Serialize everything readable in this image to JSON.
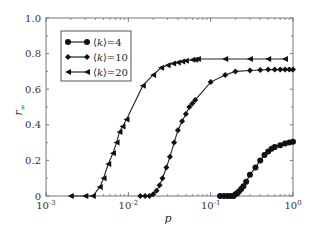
{
  "chart_data": {
    "type": "line",
    "title": "",
    "xlabel": "p",
    "ylabel": "r∞",
    "xscale": "log",
    "xlim": [
      0.001,
      1
    ],
    "ylim": [
      0,
      1.0
    ],
    "xticks": [
      {
        "value": 0.001,
        "base": "10",
        "exp": "-3"
      },
      {
        "value": 0.01,
        "base": "10",
        "exp": "-2"
      },
      {
        "value": 0.1,
        "base": "10",
        "exp": "-1"
      },
      {
        "value": 1,
        "base": "10",
        "exp": "0"
      }
    ],
    "yticks": [
      {
        "value": 0,
        "label": "0"
      },
      {
        "value": 0.2,
        "label": "0.2"
      },
      {
        "value": 0.4,
        "label": "0.4"
      },
      {
        "value": 0.6,
        "label": "0.6"
      },
      {
        "value": 0.8,
        "label": "0.8"
      },
      {
        "value": 1.0,
        "label": "1.0"
      }
    ],
    "grid": false,
    "legend_position": "upper left",
    "series": [
      {
        "name": "⟨k⟩=4",
        "legend_k": "k",
        "legend_value": "=4",
        "marker": "circle",
        "x": [
          0.13,
          0.145,
          0.16,
          0.175,
          0.19,
          0.2,
          0.21,
          0.22,
          0.235,
          0.25,
          0.27,
          0.3,
          0.35,
          0.4,
          0.45,
          0.5,
          0.55,
          0.6,
          0.7,
          0.8,
          0.9,
          1.0
        ],
        "y": [
          0.0,
          0.0,
          0.0,
          0.0,
          0.0,
          0.01,
          0.015,
          0.025,
          0.04,
          0.055,
          0.08,
          0.12,
          0.16,
          0.2,
          0.23,
          0.25,
          0.265,
          0.275,
          0.285,
          0.295,
          0.3,
          0.305
        ]
      },
      {
        "name": "⟨k⟩=10",
        "legend_k": "k",
        "legend_value": "=10",
        "marker": "diamond",
        "x": [
          0.014,
          0.016,
          0.018,
          0.02,
          0.022,
          0.024,
          0.026,
          0.029,
          0.032,
          0.036,
          0.04,
          0.045,
          0.05,
          0.055,
          0.06,
          0.065,
          0.1,
          0.15,
          0.2,
          0.3,
          0.4,
          0.5,
          0.6,
          0.7,
          0.8,
          0.9,
          1.0
        ],
        "y": [
          0.0,
          0.0,
          0.0,
          0.01,
          0.03,
          0.06,
          0.1,
          0.16,
          0.22,
          0.3,
          0.37,
          0.42,
          0.46,
          0.5,
          0.52,
          0.54,
          0.64,
          0.68,
          0.7,
          0.705,
          0.708,
          0.71,
          0.71,
          0.71,
          0.71,
          0.71,
          0.71
        ]
      },
      {
        "name": "⟨k⟩=20",
        "legend_k": "k",
        "legend_value": "=20",
        "marker": "triangle-left",
        "x": [
          0.002,
          0.003,
          0.0037,
          0.0045,
          0.005,
          0.0057,
          0.0065,
          0.0072,
          0.0078,
          0.0085,
          0.0095,
          0.015,
          0.02,
          0.025,
          0.03,
          0.035,
          0.04,
          0.045,
          0.05,
          0.06,
          0.065,
          0.07,
          0.15,
          0.3,
          0.5,
          0.8
        ],
        "y": [
          0.0,
          0.0,
          0.0,
          0.05,
          0.1,
          0.18,
          0.24,
          0.3,
          0.36,
          0.39,
          0.43,
          0.62,
          0.68,
          0.72,
          0.735,
          0.745,
          0.75,
          0.755,
          0.76,
          0.765,
          0.765,
          0.77,
          0.77,
          0.77,
          0.77,
          0.77
        ]
      }
    ]
  }
}
